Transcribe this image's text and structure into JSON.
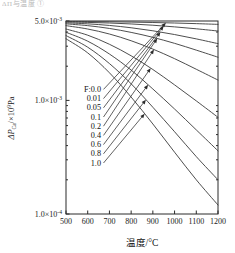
{
  "top_artifact": "ΔΠ与温度   ①",
  "axes": {
    "x_title": "温度/°C",
    "y_title_main": "ΔP",
    "y_title_sub": "Ca",
    "y_title_rest": "/×10",
    "y_title_exp": "9",
    "y_title_unit": "Pa",
    "x_ticks": [
      "500",
      "600",
      "700",
      "800",
      "900",
      "1000",
      "1100",
      "1200"
    ],
    "y_ticks": [
      {
        "mantissa": "5.0×10",
        "exp": "-3"
      },
      {
        "mantissa": "1.0×10",
        "exp": "-3"
      },
      {
        "mantissa": "1.0×10",
        "exp": "-4"
      }
    ]
  },
  "legend": {
    "labels": [
      "F:0.0",
      "0.01",
      "0.05",
      "0.1",
      "0.2",
      "0.4",
      "0.6",
      "0.8",
      "1.0"
    ]
  },
  "colors": {
    "curve": "#3a3a3a",
    "axis": "#2a2a2a",
    "background": "#ffffff"
  },
  "chart_data": {
    "type": "line",
    "title": "",
    "xlabel": "温度/°C",
    "ylabel": "ΔP_Ca /×10⁹Pa",
    "xlim": [
      500,
      1200
    ],
    "ylim": [
      0.0001,
      0.005
    ],
    "yscale": "log",
    "xscale": "linear",
    "grid": false,
    "legend_position": "inside-left",
    "x": [
      500,
      600,
      700,
      800,
      900,
      1000,
      1100,
      1200
    ],
    "series": [
      {
        "name": "F:0.0",
        "values": [
          0.00495,
          0.00494,
          0.00492,
          0.00489,
          0.00485,
          0.0048,
          0.00474,
          0.00467
        ]
      },
      {
        "name": "0.01",
        "values": [
          0.0049,
          0.00486,
          0.0048,
          0.00471,
          0.00459,
          0.00444,
          0.00427,
          0.00408
        ]
      },
      {
        "name": "0.05",
        "values": [
          0.00482,
          0.00472,
          0.00457,
          0.00436,
          0.0041,
          0.0038,
          0.00348,
          0.00316
        ]
      },
      {
        "name": "0.1",
        "values": [
          0.00472,
          0.00455,
          0.0043,
          0.00397,
          0.00359,
          0.00318,
          0.00277,
          0.0024
        ]
      },
      {
        "name": "0.2",
        "values": [
          0.00455,
          0.00425,
          0.00384,
          0.00335,
          0.00283,
          0.00233,
          0.00188,
          0.00151
        ]
      },
      {
        "name": "0.4",
        "values": [
          0.00425,
          0.00375,
          0.00312,
          0.00247,
          0.00187,
          0.00137,
          0.00099,
          0.00071
        ]
      },
      {
        "name": "0.6",
        "values": [
          0.00398,
          0.00332,
          0.00256,
          0.00185,
          0.00126,
          0.00084,
          0.00055,
          0.00036
        ]
      },
      {
        "name": "0.8",
        "values": [
          0.00372,
          0.00294,
          0.00211,
          0.0014,
          0.00087,
          0.00053,
          0.00032,
          0.0002
        ]
      },
      {
        "name": "1.0",
        "values": [
          0.00349,
          0.00262,
          0.00175,
          0.00107,
          0.00062,
          0.00035,
          0.0002,
          0.00012
        ]
      }
    ]
  }
}
